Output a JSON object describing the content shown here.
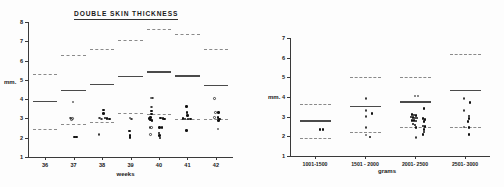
{
  "figure": {
    "background": "#fdfdfd",
    "ink": "#1a1a1a",
    "mean_color": "#4a4a4a",
    "band_color": "#8a8a8a"
  },
  "chart_data": [
    {
      "id": "weeks",
      "type": "scatter",
      "title": "DOUBLE  SKIN  THICKNESS",
      "xlabel": "weeks",
      "ylabel": "mm.",
      "xtick_labels": [
        "36",
        "37",
        "38",
        "39",
        "40",
        "41",
        "42"
      ],
      "xtick_values": [
        36,
        37,
        38,
        39,
        40,
        41,
        42
      ],
      "ytick_labels": [
        "1",
        "2",
        "3",
        "4",
        "5",
        "6",
        "7",
        "8"
      ],
      "ytick_values": [
        1,
        2,
        3,
        4,
        5,
        6,
        7,
        8
      ],
      "xlim": [
        35.4,
        42.6
      ],
      "ylim": [
        1,
        8
      ],
      "grid": false,
      "legend": null,
      "reference_bands": [
        {
          "category": "36",
          "mean": 3.92,
          "upper": 5.32,
          "lower": 2.46
        },
        {
          "category": "37",
          "mean": 4.47,
          "upper": 6.28,
          "lower": 2.72
        },
        {
          "category": "38",
          "mean": 4.8,
          "upper": 6.62,
          "lower": 2.8
        },
        {
          "category": "39",
          "mean": 5.22,
          "upper": 7.05,
          "lower": 3.3
        },
        {
          "category": "40",
          "mean": 5.45,
          "upper": 7.62,
          "lower": 3.22
        },
        {
          "category": "41",
          "mean": 5.24,
          "upper": 7.38,
          "lower": 2.95
        },
        {
          "category": "42",
          "mean": 4.74,
          "upper": 6.6,
          "lower": 2.95
        }
      ],
      "series": [
        {
          "name": "measured",
          "points": [
            {
              "x": 36.98,
              "y": 3.86,
              "marker": "open"
            },
            {
              "x": 36.9,
              "y": 3.02,
              "marker": "open"
            },
            {
              "x": 36.96,
              "y": 3.0,
              "marker": "open"
            },
            {
              "x": 36.92,
              "y": 2.94,
              "marker": "open"
            },
            {
              "x": 37.04,
              "y": 2.04,
              "marker": "filled"
            },
            {
              "x": 37.1,
              "y": 2.04,
              "marker": "filled"
            },
            {
              "x": 37.92,
              "y": 3.02,
              "marker": "open"
            },
            {
              "x": 37.98,
              "y": 2.96,
              "marker": "open"
            },
            {
              "x": 38.06,
              "y": 3.44,
              "marker": "filled"
            },
            {
              "x": 38.06,
              "y": 3.26,
              "marker": "filled"
            },
            {
              "x": 38.1,
              "y": 3.02,
              "marker": "filled"
            },
            {
              "x": 38.18,
              "y": 3.0,
              "marker": "filled"
            },
            {
              "x": 38.26,
              "y": 2.98,
              "marker": "filled"
            },
            {
              "x": 37.9,
              "y": 2.16,
              "marker": "open"
            },
            {
              "x": 38.98,
              "y": 3.02,
              "marker": "open"
            },
            {
              "x": 39.04,
              "y": 2.98,
              "marker": "open"
            },
            {
              "x": 38.96,
              "y": 2.34,
              "marker": "filled"
            },
            {
              "x": 38.98,
              "y": 2.12,
              "marker": "filled"
            },
            {
              "x": 38.98,
              "y": 2.02,
              "marker": "filled"
            },
            {
              "x": 39.72,
              "y": 4.06,
              "marker": "open"
            },
            {
              "x": 39.78,
              "y": 4.06,
              "marker": "open"
            },
            {
              "x": 39.74,
              "y": 3.6,
              "marker": "open"
            },
            {
              "x": 39.74,
              "y": 3.38,
              "marker": "filled"
            },
            {
              "x": 39.74,
              "y": 3.22,
              "marker": "filled"
            },
            {
              "x": 39.7,
              "y": 3.06,
              "marker": "filled"
            },
            {
              "x": 39.66,
              "y": 3.0,
              "marker": "filled"
            },
            {
              "x": 39.7,
              "y": 2.92,
              "marker": "filled"
            },
            {
              "x": 39.76,
              "y": 2.88,
              "marker": "filled"
            },
            {
              "x": 40.06,
              "y": 3.02,
              "marker": "filled"
            },
            {
              "x": 40.14,
              "y": 3.0,
              "marker": "filled"
            },
            {
              "x": 40.2,
              "y": 2.98,
              "marker": "filled"
            },
            {
              "x": 39.68,
              "y": 2.54,
              "marker": "open"
            },
            {
              "x": 39.74,
              "y": 2.54,
              "marker": "open"
            },
            {
              "x": 40.02,
              "y": 2.52,
              "marker": "filled"
            },
            {
              "x": 40.1,
              "y": 2.52,
              "marker": "filled"
            },
            {
              "x": 39.7,
              "y": 2.18,
              "marker": "open"
            },
            {
              "x": 40.0,
              "y": 2.24,
              "marker": "filled"
            },
            {
              "x": 40.02,
              "y": 2.1,
              "marker": "filled"
            },
            {
              "x": 40.04,
              "y": 1.98,
              "marker": "filled"
            },
            {
              "x": 40.96,
              "y": 3.62,
              "marker": "filled"
            },
            {
              "x": 40.98,
              "y": 3.3,
              "marker": "filled"
            },
            {
              "x": 41.0,
              "y": 3.16,
              "marker": "filled"
            },
            {
              "x": 40.84,
              "y": 3.0,
              "marker": "filled"
            },
            {
              "x": 40.92,
              "y": 2.98,
              "marker": "filled"
            },
            {
              "x": 41.02,
              "y": 2.98,
              "marker": "filled"
            },
            {
              "x": 41.1,
              "y": 2.96,
              "marker": "filled"
            },
            {
              "x": 40.96,
              "y": 2.38,
              "marker": "filled"
            },
            {
              "x": 41.96,
              "y": 4.04,
              "marker": "open"
            },
            {
              "x": 41.98,
              "y": 3.32,
              "marker": "open"
            },
            {
              "x": 42.1,
              "y": 3.3,
              "marker": "filled"
            },
            {
              "x": 41.96,
              "y": 3.06,
              "marker": "open"
            },
            {
              "x": 42.08,
              "y": 3.04,
              "marker": "filled"
            },
            {
              "x": 42.12,
              "y": 2.98,
              "marker": "filled"
            },
            {
              "x": 42.1,
              "y": 2.88,
              "marker": "filled"
            },
            {
              "x": 42.08,
              "y": 2.46,
              "marker": "open"
            }
          ]
        }
      ]
    },
    {
      "id": "grams",
      "type": "scatter",
      "title": "DOUBLE  SKIN  THICKNESS",
      "xlabel": "grams",
      "ylabel": "mm.",
      "xtick_labels": [
        "1001-1500",
        "1501 - 2000",
        "2001- 2500",
        "2501- 3000"
      ],
      "ytick_labels": [
        "1",
        "2",
        "3",
        "4",
        "5",
        "6",
        "7"
      ],
      "ytick_values": [
        1,
        2,
        3,
        4,
        5,
        6,
        7
      ],
      "ylim": [
        1,
        7
      ],
      "grid": false,
      "legend": null,
      "reference_bands": [
        {
          "category": "1001-1500",
          "mean": 2.82,
          "upper": 3.66,
          "lower": 1.9
        },
        {
          "category": "1501 - 2000",
          "mean": 3.56,
          "upper": 5.0,
          "lower": 2.2
        },
        {
          "category": "2001- 2500",
          "mean": 3.78,
          "upper": 5.04,
          "lower": 2.46
        },
        {
          "category": "2501- 3000",
          "mean": 4.38,
          "upper": 6.2,
          "lower": 2.46
        }
      ],
      "series": [
        {
          "name": "measured",
          "points": [
            {
              "group": 0,
              "dx": 0.1,
              "y": 2.34,
              "marker": "filled"
            },
            {
              "group": 0,
              "dx": 0.16,
              "y": 2.34,
              "marker": "filled"
            },
            {
              "group": 1,
              "dx": 0.02,
              "y": 3.92,
              "marker": "open"
            },
            {
              "group": 1,
              "dx": 0.02,
              "y": 3.32,
              "marker": "open"
            },
            {
              "group": 1,
              "dx": 0.14,
              "y": 3.16,
              "marker": "filled"
            },
            {
              "group": 1,
              "dx": 0.02,
              "y": 3.02,
              "marker": "open"
            },
            {
              "group": 1,
              "dx": 0.02,
              "y": 2.44,
              "marker": "open"
            },
            {
              "group": 1,
              "dx": 0.02,
              "y": 2.06,
              "marker": "open"
            },
            {
              "group": 1,
              "dx": 0.1,
              "y": 1.96,
              "marker": "filled"
            },
            {
              "group": 2,
              "dx": 0.0,
              "y": 4.06,
              "marker": "open"
            },
            {
              "group": 2,
              "dx": 0.06,
              "y": 4.06,
              "marker": "open"
            },
            {
              "group": 2,
              "dx": 0.18,
              "y": 3.42,
              "marker": "filled"
            },
            {
              "group": 2,
              "dx": -0.06,
              "y": 3.1,
              "marker": "filled"
            },
            {
              "group": 2,
              "dx": -0.02,
              "y": 3.08,
              "marker": "filled"
            },
            {
              "group": 2,
              "dx": 0.02,
              "y": 3.06,
              "marker": "filled"
            },
            {
              "group": 2,
              "dx": -0.08,
              "y": 2.98,
              "marker": "filled"
            },
            {
              "group": 2,
              "dx": -0.04,
              "y": 2.96,
              "marker": "filled"
            },
            {
              "group": 2,
              "dx": 0.0,
              "y": 2.94,
              "marker": "filled"
            },
            {
              "group": 2,
              "dx": 0.04,
              "y": 2.94,
              "marker": "filled"
            },
            {
              "group": 2,
              "dx": 0.16,
              "y": 2.92,
              "marker": "filled"
            },
            {
              "group": 2,
              "dx": 0.2,
              "y": 2.86,
              "marker": "filled"
            },
            {
              "group": 2,
              "dx": -0.06,
              "y": 2.82,
              "marker": "filled"
            },
            {
              "group": 2,
              "dx": -0.02,
              "y": 2.8,
              "marker": "filled"
            },
            {
              "group": 2,
              "dx": 0.02,
              "y": 2.78,
              "marker": "filled"
            },
            {
              "group": 2,
              "dx": 0.18,
              "y": 2.74,
              "marker": "filled"
            },
            {
              "group": 2,
              "dx": -0.04,
              "y": 2.62,
              "marker": "filled"
            },
            {
              "group": 2,
              "dx": 0.0,
              "y": 2.58,
              "marker": "filled"
            },
            {
              "group": 2,
              "dx": 0.16,
              "y": 2.52,
              "marker": "filled"
            },
            {
              "group": 2,
              "dx": 0.2,
              "y": 2.5,
              "marker": "filled"
            },
            {
              "group": 2,
              "dx": 0.02,
              "y": 2.44,
              "marker": "filled"
            },
            {
              "group": 2,
              "dx": 0.18,
              "y": 2.34,
              "marker": "filled"
            },
            {
              "group": 2,
              "dx": 0.18,
              "y": 2.22,
              "marker": "filled"
            },
            {
              "group": 2,
              "dx": 0.16,
              "y": 2.1,
              "marker": "filled"
            },
            {
              "group": 2,
              "dx": 0.02,
              "y": 1.94,
              "marker": "open"
            },
            {
              "group": 3,
              "dx": -0.02,
              "y": 3.92,
              "marker": "open"
            },
            {
              "group": 3,
              "dx": 0.1,
              "y": 3.72,
              "marker": "filled"
            },
            {
              "group": 3,
              "dx": -0.02,
              "y": 3.3,
              "marker": "open"
            },
            {
              "group": 3,
              "dx": 0.08,
              "y": 3.04,
              "marker": "filled"
            },
            {
              "group": 3,
              "dx": 0.08,
              "y": 2.92,
              "marker": "filled"
            },
            {
              "group": 3,
              "dx": 0.06,
              "y": 2.76,
              "marker": "filled"
            },
            {
              "group": 3,
              "dx": -0.02,
              "y": 2.48,
              "marker": "open"
            },
            {
              "group": 3,
              "dx": 0.08,
              "y": 2.46,
              "marker": "filled"
            },
            {
              "group": 3,
              "dx": 0.08,
              "y": 2.08,
              "marker": "filled"
            }
          ]
        }
      ]
    }
  ]
}
